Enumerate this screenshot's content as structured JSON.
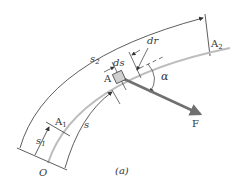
{
  "figure": {
    "caption": "(a)",
    "labels": {
      "origin": "O",
      "point_a": "A",
      "point_a1": "A",
      "point_a1_sub": "1",
      "point_a2": "A",
      "point_a2_sub": "2",
      "arc_s": "s",
      "arc_s1": "s",
      "arc_s1_sub": "1",
      "arc_s2": "s",
      "arc_s2_sub": "2",
      "ds": "ds",
      "dr": "dr",
      "alpha": "α",
      "force": "F"
    },
    "colors": {
      "line": "#333333",
      "path": "#bdbdbd",
      "force_arrow": "#707070",
      "block_fill": "#d0d0d0"
    }
  }
}
